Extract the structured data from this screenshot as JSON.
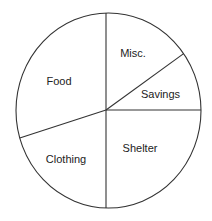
{
  "chart_data": {
    "type": "pie",
    "title": "",
    "categories": [
      "Misc.",
      "Savings",
      "Shelter",
      "Clothing",
      "Food"
    ],
    "values": [
      15,
      10,
      25,
      20,
      30
    ],
    "unit": "percent (estimated from slice angles)",
    "start_angle_deg": 90,
    "direction": "clockwise",
    "legend": "none (labels inside slices)",
    "colors": {
      "fill": "#ffffff",
      "stroke": "#333333",
      "text": "#222222"
    }
  },
  "labels": {
    "misc": "Misc.",
    "savings": "Savings",
    "shelter": "Shelter",
    "clothing": "Clothing",
    "food": "Food"
  }
}
